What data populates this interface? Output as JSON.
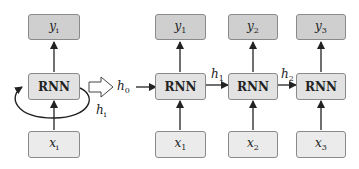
{
  "diagram": {
    "type": "rnn-unrolling",
    "folded": {
      "output": {
        "base": "y",
        "sub": "i"
      },
      "cell": "RNN",
      "input": {
        "base": "x",
        "sub": "i"
      },
      "recurrent_label": {
        "base": "h",
        "sub": "i"
      }
    },
    "transform_arrow": "unfold",
    "initial_state": {
      "base": "h",
      "sub": "0"
    },
    "unrolled": [
      {
        "output": {
          "base": "y",
          "sub": "1"
        },
        "cell": "RNN",
        "input": {
          "base": "x",
          "sub": "1"
        }
      },
      {
        "output": {
          "base": "y",
          "sub": "2"
        },
        "cell": "RNN",
        "input": {
          "base": "x",
          "sub": "2"
        }
      },
      {
        "output": {
          "base": "y",
          "sub": "3"
        },
        "cell": "RNN",
        "input": {
          "base": "x",
          "sub": "3"
        }
      }
    ],
    "hidden_links": [
      {
        "base": "h",
        "sub": "1"
      },
      {
        "base": "h",
        "sub": "2"
      }
    ],
    "colors": {
      "output_fill": "#cfcfcf",
      "cell_fill": "#e2e2e2",
      "input_fill": "#ebebeb",
      "stroke": "#8a8a8a",
      "arrow": "#222222"
    }
  }
}
